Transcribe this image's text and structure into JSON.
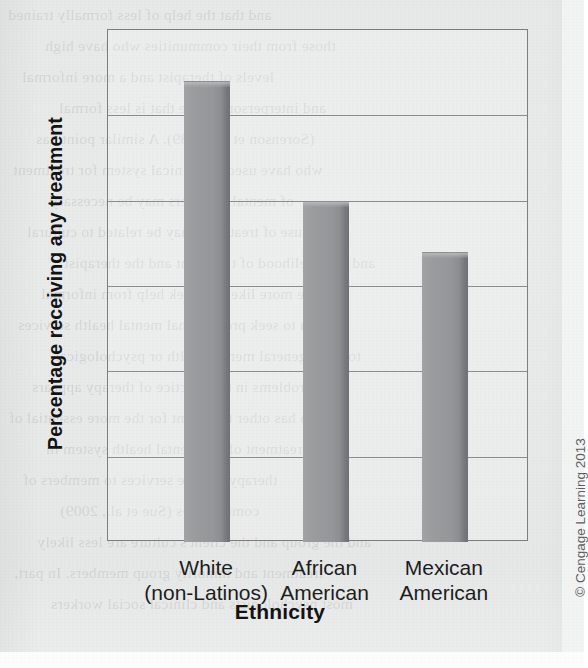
{
  "figure": {
    "credit": "© Cengage Learning 2013"
  },
  "chart_data": {
    "type": "bar",
    "title": "",
    "xlabel": "Ethnicity",
    "ylabel": "Percentage receiving any treatment",
    "categories": [
      "White\n(non-Latinos)",
      "African\nAmerican",
      "Mexican\nAmerican"
    ],
    "category_lines": [
      [
        "White",
        "(non-Latinos)"
      ],
      [
        "African",
        "American"
      ],
      [
        "Mexican",
        "American"
      ]
    ],
    "values": [
      54,
      40,
      34
    ],
    "ylim": [
      0,
      60
    ],
    "yticks": [
      0,
      10,
      20,
      30,
      40,
      50,
      60
    ],
    "ytick_labels": [
      "0",
      "10",
      "20",
      "30",
      "40",
      "50",
      "60"
    ],
    "grid": true,
    "grid_axis": "y",
    "legend": false,
    "bar_color": "#96979a",
    "axis_color": "#7b7f82"
  },
  "bleed_through": {
    "note": "faint mirrored text showing through from reverse page",
    "lines": [
      "and that the help of less formally trained",
      "those from their communities who have high",
      "levels of therapist and a more informal",
      "and interpersonal style that is less formal",
      "(Sorenson et al., 1989). A similar point has",
      "who have used the clinical system for treatment",
      "of mental disorders may be necessary",
      "This use of treatment may be related to cultural",
      "and the likelihood of the client and the therapist",
      "who are more likely to seek help from informal",
      "than to seek professional mental health services",
      "to more general mental health or psychological",
      "problems in the practice of therapy appears",
      "also has other treatment for the more essential of",
      "of treatment of the mental health system in",
      "therapy and the services to members of",
      "communities (Sue et al., 2009)",
      "and the group and the client's culture are less likely",
      "treatment and minority group members. In part,",
      "most psychologists and clinical social workers"
    ]
  }
}
